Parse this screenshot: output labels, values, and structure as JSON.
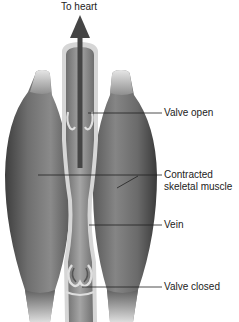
{
  "diagram": {
    "title_arrow_label": "To heart",
    "labels": [
      {
        "id": "valve_open",
        "text": "Valve open"
      },
      {
        "id": "contracted_muscle_line1",
        "text": "Contracted"
      },
      {
        "id": "contracted_muscle_line2",
        "text": "skeletal muscle"
      },
      {
        "id": "vein",
        "text": "Vein"
      },
      {
        "id": "valve_closed",
        "text": "Valve closed"
      }
    ],
    "colors": {
      "muscle_dark": "#4a4a4a",
      "muscle_mid": "#7a7a7a",
      "muscle_light": "#b8b8b8",
      "vein_wall": "#d9d9d9",
      "vein_lumen": "#8c8c8c",
      "arrow": "#454545",
      "leader_line": "#222222"
    }
  }
}
